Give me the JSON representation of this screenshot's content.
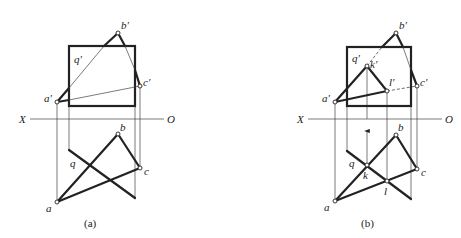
{
  "figure": {
    "colors": {
      "line": "#222222",
      "background": "#ffffff"
    },
    "axis": {
      "left_label": "X",
      "right_label": "O"
    },
    "panels": [
      {
        "id": "a",
        "caption": "(a)",
        "labels": {
          "b_front": "b'",
          "q_front": "q'",
          "c_front": "c'",
          "a_front": "a'",
          "b_top": "b",
          "q_top": "q",
          "c_top": "c",
          "a_top": "a"
        }
      },
      {
        "id": "b",
        "caption": "(b)",
        "labels": {
          "b_front": "b'",
          "q_front": "q'",
          "k_front": "k'",
          "l_front": "l'",
          "c_front": "c'",
          "a_front": "a'",
          "b_top": "b",
          "q_top": "q",
          "k_top": "k",
          "l_top": "l",
          "c_top": "c",
          "a_top": "a"
        }
      }
    ]
  }
}
